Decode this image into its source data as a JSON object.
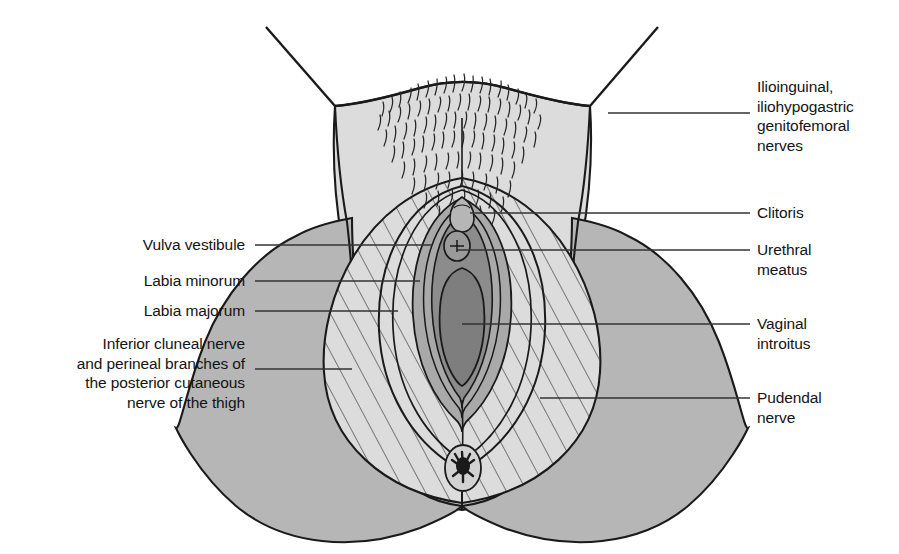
{
  "figure": {
    "type": "anatomical-line-diagram",
    "background_color": "#ffffff",
    "line_color": "#1a1a1a",
    "fill_colors": {
      "mons_and_skin_light": "#dcdcdc",
      "thigh_medium_gray": "#b6b6b6",
      "pudendal_hatched_fill": "#dcdcdc",
      "labia_minora_midgray": "#a9a9a9",
      "vestibule_dark": "#8c8c8c",
      "introitus_darkest": "#7e7e7e",
      "anus_black": "#1a1a1a"
    }
  },
  "labels": {
    "right": [
      {
        "id": "ilioinguinal",
        "text": "Ilioinguinal,\niliohypogastric\ngenitofemoral\nnerves",
        "text_x": 757,
        "text_y": 77,
        "leader_y": 113,
        "leader_x_start": 608,
        "leader_x_end": 750
      },
      {
        "id": "clitoris",
        "text": "Clitoris",
        "text_x": 757,
        "text_y": 203,
        "leader_y": 213,
        "leader_x_start": 470,
        "leader_x_end": 750
      },
      {
        "id": "urethral-meatus",
        "text": "Urethral\nmeatus",
        "text_x": 757,
        "text_y": 240,
        "leader_y": 250,
        "leader_x_start": 456,
        "leader_x_end": 750
      },
      {
        "id": "vaginal-introitus",
        "text": "Vaginal\nintroitus",
        "text_x": 757,
        "text_y": 314,
        "leader_y": 324,
        "leader_x_start": 462,
        "leader_x_end": 750
      },
      {
        "id": "pudendal-nerve",
        "text": "Pudendal\nnerve",
        "text_x": 757,
        "text_y": 388,
        "leader_y": 398,
        "leader_x_start": 540,
        "leader_x_end": 750
      }
    ],
    "left": [
      {
        "id": "vulva-vestibule",
        "text": "Vulva vestibule",
        "text_right": 245,
        "text_y": 235,
        "leader_y": 245,
        "leader_x_start": 255,
        "leader_x_end": 430
      },
      {
        "id": "labia-minorum",
        "text": "Labia minorum",
        "text_right": 245,
        "text_y": 271,
        "leader_y": 281,
        "leader_x_start": 255,
        "leader_x_end": 420
      },
      {
        "id": "labia-majorum",
        "text": "Labia majorum",
        "text_right": 245,
        "text_y": 301,
        "leader_y": 311,
        "leader_x_start": 255,
        "leader_x_end": 400
      },
      {
        "id": "inferior-cluneal-nerve",
        "text": "Inferior cluneal nerve\nand perineal branches of\nthe posterior cutaneous\nnerve of the thigh",
        "text_right": 245,
        "text_y": 334,
        "leader_y": 369,
        "leader_x_start": 255,
        "leader_x_end": 350
      }
    ]
  }
}
